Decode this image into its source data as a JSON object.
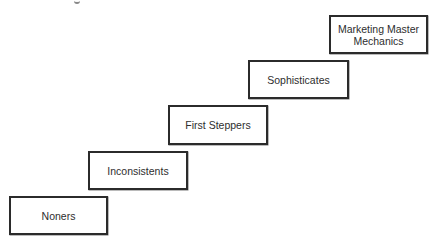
{
  "diagram": {
    "type": "staircase",
    "direction": "ascending-left-to-right",
    "steps": [
      {
        "label": "Noners",
        "level": 1
      },
      {
        "label": "Inconsistents",
        "level": 2
      },
      {
        "label": "First Steppers",
        "level": 3
      },
      {
        "label": "Sophisticates",
        "level": 4
      },
      {
        "label": "Marketing Master Mechanics",
        "level": 5
      }
    ]
  },
  "colors": {
    "border": "#2b2b2b",
    "text": "#2e2e2e",
    "background": "#ffffff"
  }
}
